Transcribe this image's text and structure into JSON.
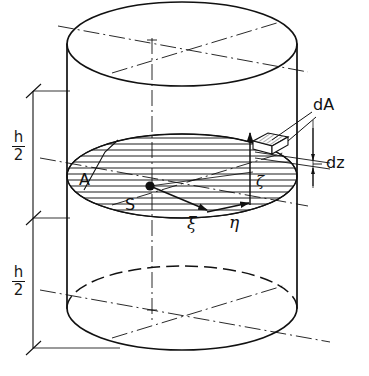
{
  "figure": {
    "type": "engineering-drawing",
    "background_color": "#ffffff",
    "line_color": "#111111",
    "width": 369,
    "height": 376
  },
  "labels": {
    "area": "A",
    "centroid": "S",
    "axis_xi": "ξ",
    "axis_eta": "η",
    "axis_zeta": "ζ",
    "element_area": "dA",
    "element_thickness": "dz",
    "height_numerator": "h",
    "height_denominator": "2"
  },
  "dimensions": {
    "upper": {
      "numerator": "h",
      "denominator": "2"
    },
    "lower": {
      "numerator": "h",
      "denominator": "2"
    }
  },
  "geometry": {
    "cylinder": {
      "left_wall_x": 67,
      "right_wall_x": 297,
      "top_center": {
        "x": 182,
        "y": 44
      },
      "mid_center": {
        "x": 182,
        "y": 176
      },
      "bottom_center": {
        "x": 182,
        "y": 308
      },
      "radius_x": 115,
      "radius_y": 42
    },
    "centroid_point": {
      "x": 150,
      "y": 186
    },
    "element_box": {
      "x": 255,
      "y": 139
    },
    "dimension_line_x": 33,
    "dimension_ticks_y": [
      91,
      218,
      348
    ]
  },
  "styles": {
    "visible_edge": "solid",
    "hidden_edge": "dashed",
    "center_line": "dash-dot",
    "section_fill": "hatch-horizontal"
  }
}
